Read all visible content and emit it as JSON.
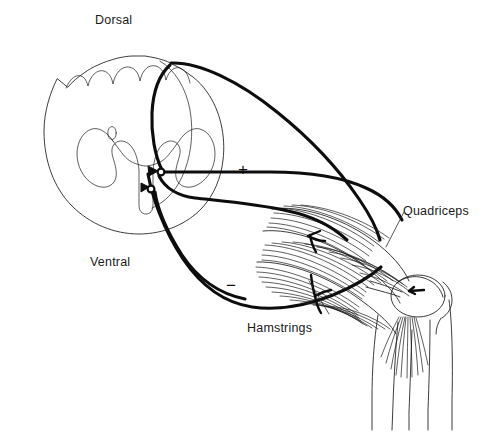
{
  "figure": {
    "background_color": "#ffffff",
    "ink_color": "#1a1a1a",
    "nerve_color": "#0d0d0d",
    "width": 482,
    "height": 434
  },
  "labels": {
    "dorsal": "Dorsal",
    "ventral": "Ventral",
    "quadriceps": "Quadriceps",
    "hamstrings": "Hamstrings",
    "excitatory_sign": "+",
    "inhibitory_sign": "−"
  },
  "structures": [
    {
      "name": "spinal-cord-outline",
      "kind": "cross-section-boundary"
    },
    {
      "name": "gray-matter-butterfly",
      "kind": "gray-matter"
    },
    {
      "name": "central-canal",
      "kind": "canal"
    },
    {
      "name": "motor-neuron-soma-alpha",
      "kind": "cell-body"
    },
    {
      "name": "motor-neuron-soma-inhibitory",
      "kind": "cell-body"
    },
    {
      "name": "sensory-afferent-fiber",
      "kind": "nerve"
    },
    {
      "name": "motor-efferent-fiber-quadriceps",
      "kind": "nerve"
    },
    {
      "name": "motor-efferent-fiber-hamstrings",
      "kind": "nerve"
    },
    {
      "name": "thigh-outline",
      "kind": "limb-contour"
    },
    {
      "name": "quadriceps-muscle",
      "kind": "muscle"
    },
    {
      "name": "hamstrings-muscle",
      "kind": "muscle"
    },
    {
      "name": "patella",
      "kind": "bone"
    },
    {
      "name": "patellar-tendon",
      "kind": "tendon"
    },
    {
      "name": "lower-leg",
      "kind": "limb-contour"
    }
  ],
  "annotations": {
    "quadriceps_leader": "leader-line-quadriceps",
    "hamstrings_leader": "leader-line-hamstrings"
  }
}
